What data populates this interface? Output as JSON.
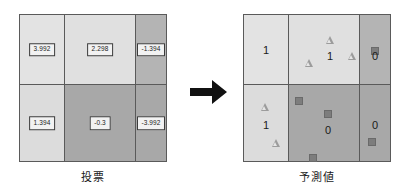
{
  "figure": {
    "arrow_icon": "arrow-right-icon",
    "panels": [
      {
        "id": "vote",
        "caption": "投票",
        "grid": {
          "rows": 2,
          "cols": 3
        },
        "cells": [
          {
            "row": 0,
            "col": 0,
            "label": "3.992",
            "fill": "#e3e3e3"
          },
          {
            "row": 0,
            "col": 1,
            "label": "2.298",
            "fill": "#e0e0e0"
          },
          {
            "row": 0,
            "col": 2,
            "label": "-1.394",
            "fill": "#b4b4b4"
          },
          {
            "row": 1,
            "col": 0,
            "label": "1.394",
            "fill": "#dcdcdc"
          },
          {
            "row": 1,
            "col": 1,
            "label": "-0.3",
            "fill": "#a8a8a8"
          },
          {
            "row": 1,
            "col": 2,
            "label": "-3.992",
            "fill": "#a8a8a8"
          }
        ]
      },
      {
        "id": "prediction",
        "caption": "予測値",
        "grid": {
          "rows": 2,
          "cols": 3
        },
        "cells": [
          {
            "row": 0,
            "col": 0,
            "label": "1",
            "fill": "#e3e3e3"
          },
          {
            "row": 0,
            "col": 1,
            "label": "1",
            "fill": "#e0e0e0"
          },
          {
            "row": 0,
            "col": 2,
            "label": "0",
            "fill": "#b4b4b4"
          },
          {
            "row": 1,
            "col": 0,
            "label": "1",
            "fill": "#dcdcdc"
          },
          {
            "row": 1,
            "col": 1,
            "label": "0",
            "fill": "#a8a8a8"
          },
          {
            "row": 1,
            "col": 2,
            "label": "0",
            "fill": "#a8a8a8"
          }
        ],
        "markers": [
          {
            "shape": "triangle",
            "x": 86,
            "y": 25
          },
          {
            "shape": "triangle",
            "x": 65,
            "y": 48
          },
          {
            "shape": "triangle",
            "x": 108,
            "y": 41
          },
          {
            "shape": "square",
            "x": 131,
            "y": 36
          },
          {
            "shape": "triangle",
            "x": 21,
            "y": 92
          },
          {
            "shape": "triangle",
            "x": 32,
            "y": 128
          },
          {
            "shape": "square",
            "x": 55,
            "y": 86
          },
          {
            "shape": "square",
            "x": 84,
            "y": 99
          },
          {
            "shape": "square",
            "x": 69,
            "y": 143
          },
          {
            "shape": "square",
            "x": 128,
            "y": 127
          }
        ]
      }
    ]
  }
}
